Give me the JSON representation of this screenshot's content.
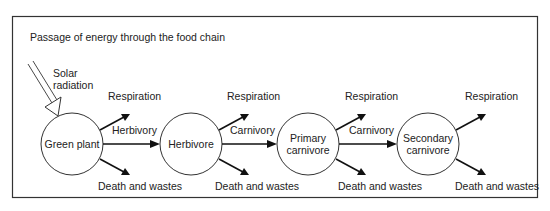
{
  "title": "Passage of energy through the food chain",
  "source": {
    "label_line1": "Solar",
    "label_line2": "radiation"
  },
  "nodes": [
    {
      "id": "green-plant",
      "line1": "Green plant",
      "line2": ""
    },
    {
      "id": "herbivore",
      "line1": "Herbivore",
      "line2": ""
    },
    {
      "id": "primary-carnivore",
      "line1": "Primary",
      "line2": "carnivore"
    },
    {
      "id": "secondary-carnivore",
      "line1": "Secondary",
      "line2": "carnivore"
    }
  ],
  "transfers": [
    {
      "from": "green-plant",
      "to": "herbivore",
      "label": "Herbivory"
    },
    {
      "from": "herbivore",
      "to": "primary-carnivore",
      "label": "Carnivory"
    },
    {
      "from": "primary-carnivore",
      "to": "secondary-carnivore",
      "label": "Carnivory"
    }
  ],
  "losses": {
    "upper_label": "Respiration",
    "lower_label": "Death and wastes"
  },
  "colors": {
    "line": "#111111",
    "text": "#222222",
    "frame": "#333333",
    "background": "#ffffff"
  }
}
